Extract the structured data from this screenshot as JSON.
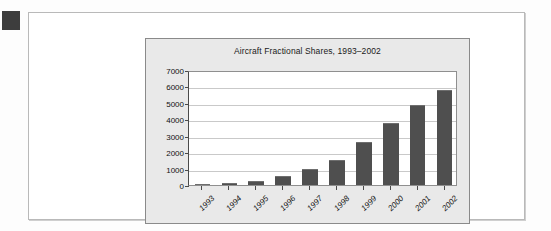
{
  "page": {
    "marker_name": "black-square-marker"
  },
  "chart_data": {
    "type": "bar",
    "title": "Aircraft Fractional Shares, 1993–2002",
    "xlabel": "",
    "ylabel": "",
    "categories": [
      "1993",
      "1994",
      "1995",
      "1996",
      "1997",
      "1998",
      "1999",
      "2000",
      "2001",
      "2002"
    ],
    "values": [
      80,
      140,
      260,
      520,
      950,
      1550,
      2600,
      3800,
      4850,
      5800
    ],
    "ylim": [
      0,
      7000
    ],
    "ytick_labels": [
      "0",
      "1000",
      "2000",
      "3000",
      "4000",
      "5000",
      "6000",
      "7000"
    ],
    "ytick_values": [
      0,
      1000,
      2000,
      3000,
      4000,
      5000,
      6000,
      7000
    ],
    "grid": true,
    "legend": null,
    "legend_position": "none",
    "series": [
      {
        "name": "Aircraft Fractional Shares",
        "values": [
          80,
          140,
          260,
          520,
          950,
          1550,
          2600,
          3800,
          4850,
          5800
        ]
      }
    ]
  },
  "colors": {
    "bar_fill": "#4f4f4f",
    "panel_background": "#e9e9e9",
    "plot_background": "#ffffff",
    "gridline": "#c9c9c9",
    "axis_line": "#4a4a4a",
    "page_background": "#ffffff",
    "marker": "#3d3d3d",
    "text": "#111111"
  }
}
